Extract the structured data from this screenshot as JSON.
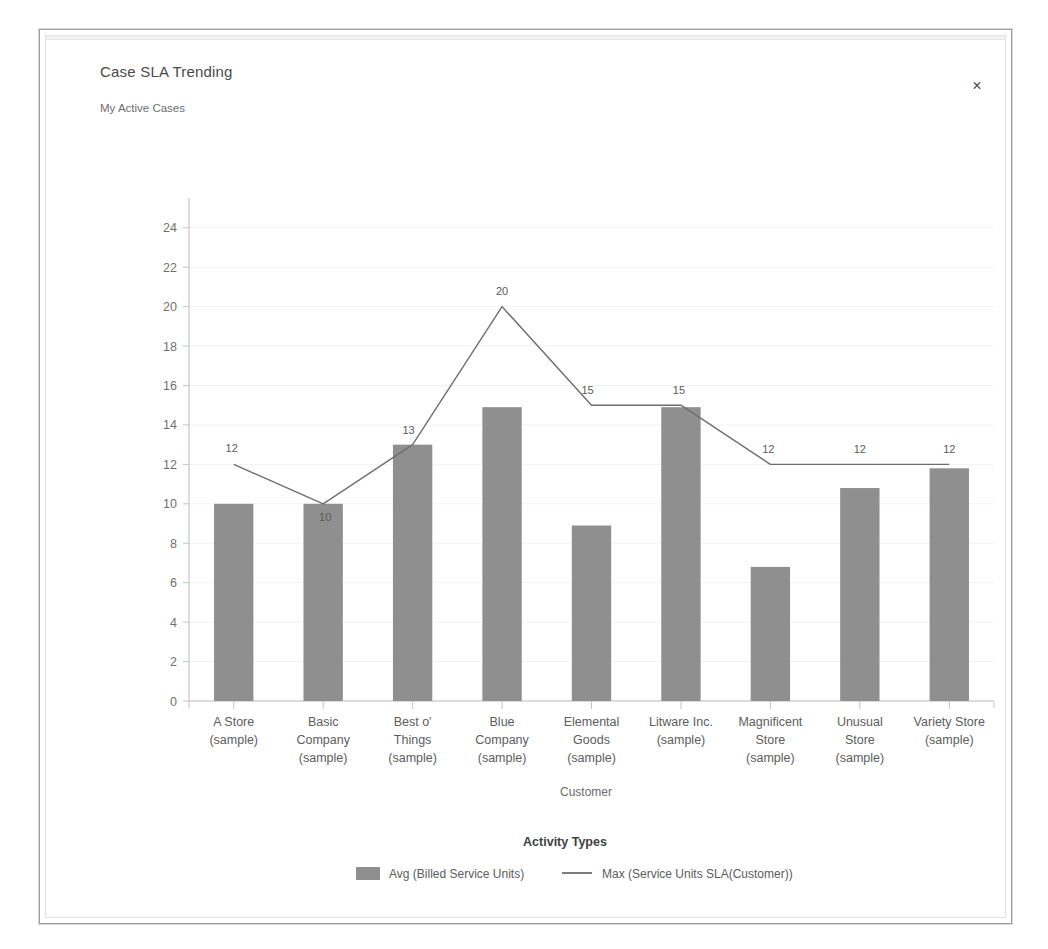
{
  "dialog": {
    "title": "Case SLA Trending",
    "subtitle": "My Active Cases",
    "close_label": "×",
    "close_icon": "close-icon"
  },
  "colors": {
    "bar_fill": "#8f8f8f",
    "line_stroke": "#6e6e6e",
    "grid": "#f0f2f4",
    "axis": "#b9b9b9",
    "text": "#5c5c5c",
    "background": "#ffffff"
  },
  "chart_data": {
    "type": "bar",
    "title": "Case SLA Trending",
    "subtitle": "My Active Cases",
    "xlabel": "Customer",
    "ylabel": "",
    "ylim": [
      0,
      25
    ],
    "grid": true,
    "legend_position": "bottom",
    "legend_title": "Activity Types",
    "categories": [
      "A Store (sample)",
      "Basic Company (sample)",
      "Best o' Things (sample)",
      "Blue Company (sample)",
      "Elemental Goods (sample)",
      "Litware Inc. (sample)",
      "Magnificent Store (sample)",
      "Unusual Store (sample)",
      "Variety Store (sample)"
    ],
    "category_lines": [
      [
        "A Store",
        "(sample)"
      ],
      [
        "Basic",
        "Company",
        "(sample)"
      ],
      [
        "Best o'",
        "Things",
        "(sample)"
      ],
      [
        "Blue",
        "Company",
        "(sample)"
      ],
      [
        "Elemental",
        "Goods",
        "(sample)"
      ],
      [
        "Litware Inc.",
        "(sample)"
      ],
      [
        "Magnificent",
        "Store",
        "(sample)"
      ],
      [
        "Unusual",
        "Store",
        "(sample)"
      ],
      [
        "Variety Store",
        "(sample)"
      ]
    ],
    "yticks": [
      0,
      2,
      4,
      6,
      8,
      10,
      12,
      14,
      16,
      18,
      20,
      22,
      24
    ],
    "series": [
      {
        "name": "Avg (Billed Service Units)",
        "type": "bar",
        "values": [
          10,
          10,
          13,
          14.9,
          8.9,
          14.9,
          6.8,
          10.8,
          11.8
        ],
        "labels": [
          "",
          "",
          "",
          "",
          "",
          "",
          "",
          "",
          ""
        ]
      },
      {
        "name": "Max (Service Units SLA(Customer))",
        "type": "line",
        "values": [
          12,
          10,
          13,
          20,
          15,
          15,
          12,
          12,
          12
        ],
        "labels": [
          "12",
          "10",
          "13",
          "20",
          "15",
          "15",
          "12",
          "12",
          "12"
        ]
      }
    ]
  },
  "legend": {
    "title": "Activity Types",
    "items": [
      {
        "label": "Avg (Billed Service Units)",
        "marker": "swatch"
      },
      {
        "label": "Max (Service Units SLA(Customer))",
        "marker": "line"
      }
    ]
  }
}
